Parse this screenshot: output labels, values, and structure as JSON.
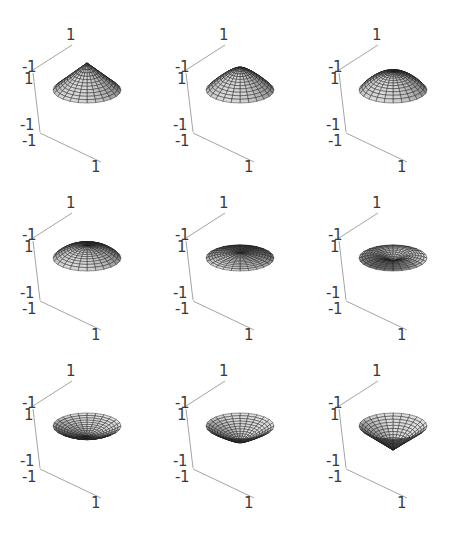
{
  "chart_data": {
    "type": "surface3d-grid",
    "title": "",
    "layout": {
      "rows": 3,
      "cols": 3
    },
    "axes": {
      "x_range": [
        -1,
        1
      ],
      "y_range": [
        -1,
        1
      ],
      "z_range": [
        -1,
        1
      ],
      "tick_labels": {
        "back_top": "1",
        "corner_top_a": "-1",
        "corner_top_b": "1",
        "corner_bottom_a": "-1",
        "corner_bottom_b": "-1",
        "front_right": "1"
      },
      "box": "partial",
      "grid": false
    },
    "panels": [
      {
        "index": 1,
        "shape": "cone-up (sharp peak)",
        "apex_z": 0.9,
        "profile_power": 1.0,
        "rim_z": 0.0
      },
      {
        "index": 2,
        "shape": "cone-up (rounded peak)",
        "apex_z": 0.75,
        "profile_power": 1.4,
        "rim_z": 0.0
      },
      {
        "index": 3,
        "shape": "dome",
        "apex_z": 0.6,
        "profile_power": 2.0,
        "rim_z": 0.0
      },
      {
        "index": 4,
        "shape": "flattened dome",
        "apex_z": 0.4,
        "profile_power": 2.5,
        "rim_z": 0.0
      },
      {
        "index": 5,
        "shape": "near-flat disc",
        "apex_z": 0.15,
        "profile_power": 3.0,
        "rim_z": 0.0
      },
      {
        "index": 6,
        "shape": "torus-like dish (center dip)",
        "apex_z": -0.1,
        "profile_power": 2.0,
        "rim_z": 0.0
      },
      {
        "index": 7,
        "shape": "bowl (shallow)",
        "apex_z": -0.35,
        "profile_power": 1.6,
        "rim_z": 0.0
      },
      {
        "index": 8,
        "shape": "inverted cone (rounded)",
        "apex_z": -0.55,
        "profile_power": 1.2,
        "rim_z": 0.0
      },
      {
        "index": 9,
        "shape": "inverted cone (deep)",
        "apex_z": -0.8,
        "profile_power": 1.0,
        "rim_z": 0.0
      }
    ],
    "mesh": {
      "radial_lines": 24,
      "rings": 12
    }
  },
  "style": {
    "axis_color": "#9a9a9a",
    "mesh_line_color": "#1a1a1a",
    "face_light": "#d8d8d8",
    "face_dark": "#3a3a3a",
    "tick_color": "#3a3a3a"
  }
}
